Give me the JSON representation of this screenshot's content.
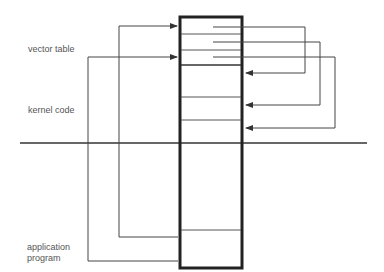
{
  "labels": {
    "vector_table": "vector table",
    "kernel_code": "kernel code",
    "application_line1": "application",
    "application_line2": "program"
  },
  "colors": {
    "line": "#333333",
    "box": "#222222",
    "text": "#555555"
  }
}
